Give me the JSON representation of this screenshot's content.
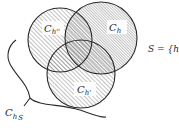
{
  "diagram": {
    "type": "venn",
    "circles": [
      {
        "id": "top-left",
        "label": "C",
        "subscript": "h''",
        "cx": 60,
        "cy": 40,
        "r": 32
      },
      {
        "id": "top-right",
        "label": "C",
        "subscript": "h",
        "cx": 101,
        "cy": 38,
        "r": 36
      },
      {
        "id": "bottom",
        "label": "C",
        "subscript": "h'",
        "cx": 81,
        "cy": 74,
        "r": 34
      }
    ],
    "set_label": "S = {h}",
    "brace_label": {
      "main": "C",
      "sub": "h",
      "subsub": "S"
    },
    "colors": {
      "stroke": "#2a2a2a",
      "hatch": "#6a6a6a",
      "background": "#ffffff"
    }
  }
}
